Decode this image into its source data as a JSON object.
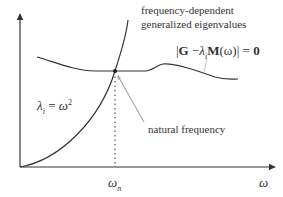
{
  "diagram": {
    "title_line1": "frequency-dependent",
    "title_line2": "generalized eigenvalues",
    "equation_curve_label": {
      "bars_open": "|",
      "G": "G",
      "minus": " −",
      "lambda": "λ",
      "lambda_sub": "i",
      "M": "M",
      "arg": "(ω)",
      "bars_close": "| = ",
      "zero": "0"
    },
    "parabola_label": {
      "lambda": "λ",
      "lambda_sub": "i",
      "eq": " = ",
      "omega": "ω",
      "sup": "2"
    },
    "natural_frequency_label": "natural frequency",
    "x_tick_label": {
      "omega": "ω",
      "sub": "n"
    },
    "x_axis_label": "ω",
    "colors": {
      "line": "#333333",
      "pointer": "#777777",
      "background": "#ffffff"
    }
  }
}
